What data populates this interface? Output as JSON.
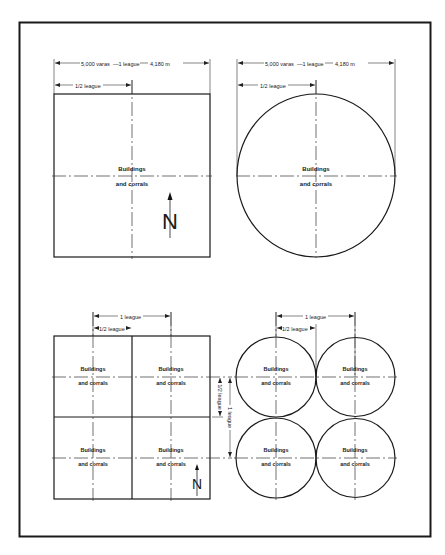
{
  "figure": {
    "top_section": {
      "square_parcel": {
        "overall_dimension_label": {
          "part1": "5,000 varas",
          "part2": "—1 league",
          "part3": "4,180 m"
        },
        "half_dimension_label": "1/2 league",
        "center_label_line1": "Buildings",
        "center_label_line2": "and corrals",
        "north_label": "N"
      },
      "circular_parcel": {
        "overall_dimension_label": {
          "part1": "5,000 varas",
          "part2": "—1 league",
          "part3": "4,180 m"
        },
        "half_dimension_label": "1/2 league",
        "center_label_line1": "Buildings",
        "center_label_line2": "and corrals"
      }
    },
    "bottom_section": {
      "square_grid": {
        "top_dimension_label": "1 league",
        "half_dimension_label": "1/2 league",
        "cells": [
          {
            "line1": "Buildings",
            "line2": "and corrals"
          },
          {
            "line1": "Buildings",
            "line2": "and corrals"
          },
          {
            "line1": "Buildings",
            "line2": "and corrals"
          },
          {
            "line1": "Buildings",
            "line2": "and corrals"
          }
        ],
        "north_label": "N"
      },
      "vertical_dimensions": {
        "half_label": "1/2 league",
        "full_label": "1 league"
      },
      "circle_grid": {
        "top_dimension_label": "1 league",
        "half_dimension_label": "1/2 league",
        "cells": [
          {
            "line1": "Buildings",
            "line2": "and corrals"
          },
          {
            "line1": "Buildings",
            "line2": "and corrals"
          },
          {
            "line1": "Buildings",
            "line2": "and corrals"
          },
          {
            "line1": "Buildings",
            "line2": "and corrals"
          }
        ]
      }
    }
  }
}
